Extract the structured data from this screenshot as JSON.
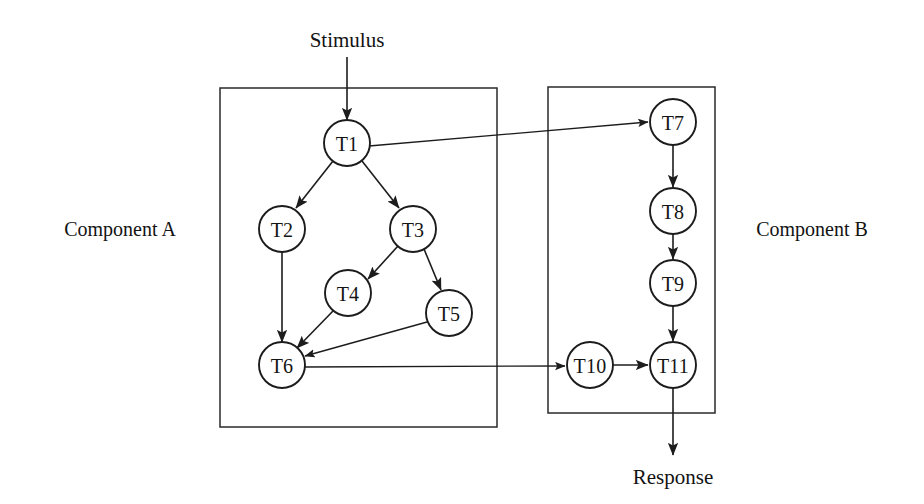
{
  "diagram": {
    "colors": {
      "stroke": "#1c1c1c",
      "node_fill": "#ffffff",
      "background": "#ffffff",
      "text": "#131313"
    },
    "io_labels": {
      "stimulus": "Stimulus",
      "response": "Response"
    },
    "components": [
      {
        "id": "component-a",
        "label": "Component A",
        "label_x": 120,
        "label_y": 229,
        "box": {
          "x": 220,
          "y": 88,
          "width": 277,
          "height": 339
        }
      },
      {
        "id": "component-b",
        "label": "Component B",
        "label_x": 812,
        "label_y": 229,
        "box": {
          "x": 548,
          "y": 87,
          "width": 167,
          "height": 326
        }
      }
    ],
    "nodes": [
      {
        "id": "T1",
        "label": "T1",
        "cx": 347,
        "cy": 143,
        "r": 23,
        "component": "component-a"
      },
      {
        "id": "T2",
        "label": "T2",
        "cx": 282,
        "cy": 229,
        "r": 23,
        "component": "component-a"
      },
      {
        "id": "T3",
        "label": "T3",
        "cx": 413,
        "cy": 229,
        "r": 23,
        "component": "component-a"
      },
      {
        "id": "T4",
        "label": "T4",
        "cx": 348,
        "cy": 293,
        "r": 23,
        "component": "component-a"
      },
      {
        "id": "T5",
        "label": "T5",
        "cx": 449,
        "cy": 313,
        "r": 23,
        "component": "component-a"
      },
      {
        "id": "T6",
        "label": "T6",
        "cx": 282,
        "cy": 365,
        "r": 23,
        "component": "component-a"
      },
      {
        "id": "T7",
        "label": "T7",
        "cx": 673,
        "cy": 122,
        "r": 23,
        "component": "component-b"
      },
      {
        "id": "T8",
        "label": "T8",
        "cx": 673,
        "cy": 211,
        "r": 23,
        "component": "component-b"
      },
      {
        "id": "T9",
        "label": "T9",
        "cx": 673,
        "cy": 283,
        "r": 23,
        "component": "component-b"
      },
      {
        "id": "T10",
        "label": "T10",
        "cx": 590,
        "cy": 365,
        "r": 23,
        "component": "component-b"
      },
      {
        "id": "T11",
        "label": "T11",
        "cx": 673,
        "cy": 365,
        "r": 23,
        "component": "component-b"
      }
    ],
    "edges": [
      {
        "id": "stimulus-to-T1",
        "from": "Stimulus",
        "to": "T1",
        "x1": 347,
        "y1": 57,
        "x2": 347,
        "y2": 120
      },
      {
        "id": "T1-to-T2",
        "from": "T1",
        "to": "T2",
        "x1": 333,
        "y1": 161,
        "x2": 296,
        "y2": 208
      },
      {
        "id": "T1-to-T3",
        "from": "T1",
        "to": "T3",
        "x1": 362,
        "y1": 161,
        "x2": 399,
        "y2": 208
      },
      {
        "id": "T1-to-T7",
        "from": "T1",
        "to": "T7",
        "x1": 369,
        "y1": 146,
        "x2": 648,
        "y2": 122
      },
      {
        "id": "T2-to-T6",
        "from": "T2",
        "to": "T6",
        "x1": 282,
        "y1": 252,
        "x2": 282,
        "y2": 342
      },
      {
        "id": "T3-to-T4",
        "from": "T3",
        "to": "T4",
        "x1": 398,
        "y1": 246,
        "x2": 368,
        "y2": 279
      },
      {
        "id": "T3-to-T5",
        "from": "T3",
        "to": "T5",
        "x1": 424,
        "y1": 249,
        "x2": 441,
        "y2": 290
      },
      {
        "id": "T4-to-T6",
        "from": "T4",
        "to": "T6",
        "x1": 333,
        "y1": 311,
        "x2": 297,
        "y2": 348
      },
      {
        "id": "T5-to-T6",
        "from": "T5",
        "to": "T6",
        "x1": 427,
        "y1": 322,
        "x2": 305,
        "y2": 356
      },
      {
        "id": "T6-to-T10",
        "from": "T6",
        "to": "T10",
        "x1": 305,
        "y1": 367,
        "x2": 565,
        "y2": 366
      },
      {
        "id": "T7-to-T8",
        "from": "T7",
        "to": "T8",
        "x1": 673,
        "y1": 145,
        "x2": 673,
        "y2": 187
      },
      {
        "id": "T8-to-T9",
        "from": "T8",
        "to": "T9",
        "x1": 673,
        "y1": 234,
        "x2": 673,
        "y2": 259
      },
      {
        "id": "T9-to-T11",
        "from": "T9",
        "to": "T11",
        "x1": 673,
        "y1": 306,
        "x2": 673,
        "y2": 341
      },
      {
        "id": "T10-to-T11",
        "from": "T10",
        "to": "T11",
        "x1": 613,
        "y1": 365,
        "x2": 648,
        "y2": 365
      },
      {
        "id": "T11-to-response",
        "from": "T11",
        "to": "Response",
        "x1": 673,
        "y1": 388,
        "x2": 673,
        "y2": 455
      }
    ],
    "stimulus_label_pos": {
      "x": 347,
      "y": 40
    },
    "response_label_pos": {
      "x": 673,
      "y": 477
    }
  }
}
